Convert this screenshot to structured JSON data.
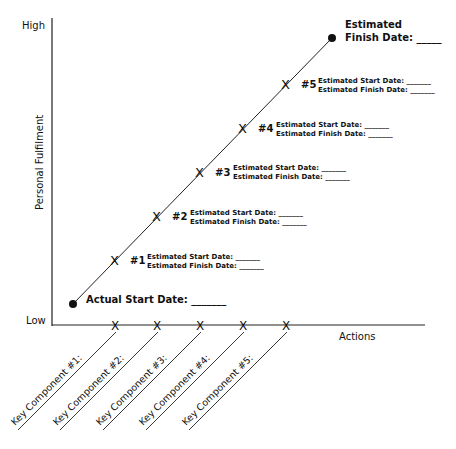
{
  "axes": {
    "y_high": "High",
    "y_low": "Low",
    "y_title": "Personal Fulfilment",
    "x_title": "Actions"
  },
  "start": {
    "label": "Actual Start Date: _______"
  },
  "finish": {
    "line1": "Estimated",
    "line2": "Finish Date: _____"
  },
  "milestones": [
    {
      "num": "#1",
      "start": "Estimated Start Date: _______",
      "finish": "Estimated Finish Date: _______"
    },
    {
      "num": "#2",
      "start": "Estimated Start Date: _______",
      "finish": "Estimated Finish Date: _______"
    },
    {
      "num": "#3",
      "start": "Estimated Start Date: _______",
      "finish": "Estimated Finish Date: _______"
    },
    {
      "num": "#4",
      "start": "Estimated Start Date: _______",
      "finish": "Estimated Finish Date: _______"
    },
    {
      "num": "#5",
      "start": "Estimated Start Date: _______",
      "finish": "Estimated Finish Date: _______"
    }
  ],
  "key_components": [
    {
      "label": "Key Component #1:"
    },
    {
      "label": "Key Component #2:"
    },
    {
      "label": "Key Component #3:"
    },
    {
      "label": "Key Component #4:"
    },
    {
      "label": "Key Component #5:"
    }
  ],
  "colors": {
    "ink": "#111111",
    "background": "#ffffff"
  }
}
